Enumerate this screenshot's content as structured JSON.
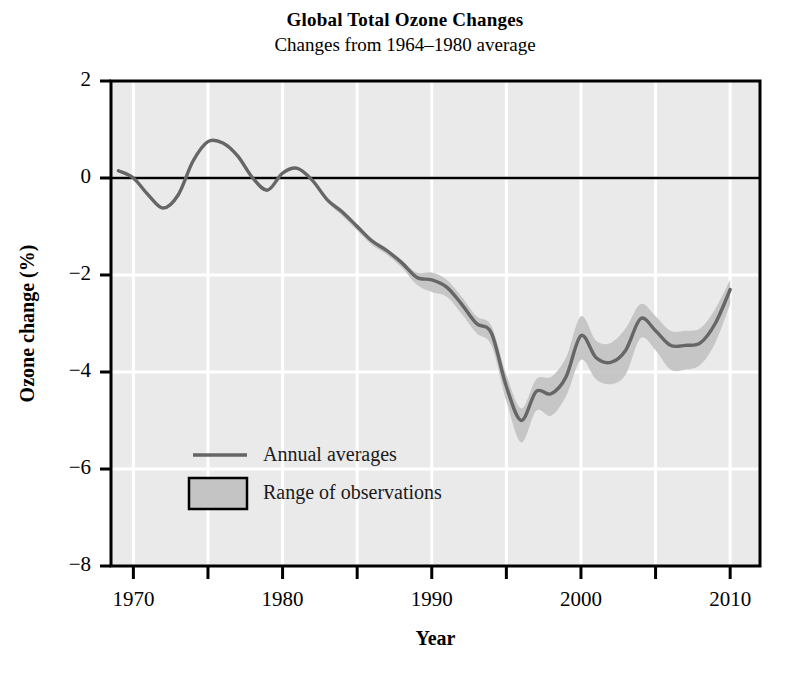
{
  "figure": {
    "title": "Global Total Ozone Changes",
    "subtitle": "Changes from 1964–1980 average",
    "background": "#ffffff"
  },
  "chart_data": {
    "type": "line",
    "title": "Global Total Ozone Changes",
    "subtitle": "Changes from 1964–1980 average",
    "xlabel": "Year",
    "ylabel": "Ozone change (%)",
    "xlim": [
      1968.5,
      2012.0
    ],
    "ylim": [
      -8,
      2
    ],
    "xticks": [
      1970,
      1975,
      1980,
      1985,
      1990,
      1995,
      2000,
      2005,
      2010
    ],
    "xtick_labels": [
      "1970",
      "",
      "1980",
      "",
      "1990",
      "",
      "2000",
      "",
      "2010"
    ],
    "yticks": [
      2,
      0,
      -2,
      -4,
      -6,
      -8
    ],
    "ytick_labels": [
      "2",
      "0",
      "−2",
      "−4",
      "−6",
      "−8"
    ],
    "grid": true,
    "grid_color": "#ffffff",
    "plot_background": "#eaeaea",
    "zero_line": 0,
    "zero_line_color": "#000000",
    "legend_position": "inside-lower-left",
    "legend": [
      {
        "name": "Annual averages",
        "type": "line",
        "color": "#666666"
      },
      {
        "name": "Range of observations",
        "type": "band",
        "color": "#c4c4c4",
        "edge": "#000000"
      }
    ],
    "series": [
      {
        "name": "Annual averages",
        "color": "#666666",
        "x": [
          1969,
          1970,
          1971,
          1972,
          1973,
          1974,
          1975,
          1976,
          1977,
          1978,
          1979,
          1980,
          1981,
          1982,
          1983,
          1984,
          1985,
          1986,
          1987,
          1988,
          1989,
          1990,
          1991,
          1992,
          1993,
          1994,
          1995,
          1996,
          1997,
          1998,
          1999,
          2000,
          2001,
          2002,
          2003,
          2004,
          2005,
          2006,
          2007,
          2008,
          2009,
          2010
        ],
        "values": [
          0.15,
          0.0,
          -0.35,
          -0.62,
          -0.35,
          0.35,
          0.75,
          0.72,
          0.45,
          0.0,
          -0.25,
          0.1,
          0.2,
          -0.05,
          -0.45,
          -0.7,
          -1.0,
          -1.3,
          -1.5,
          -1.75,
          -2.05,
          -2.1,
          -2.25,
          -2.6,
          -3.0,
          -3.2,
          -4.3,
          -5.0,
          -4.4,
          -4.45,
          -4.1,
          -3.25,
          -3.7,
          -3.8,
          -3.55,
          -2.9,
          -3.15,
          -3.45,
          -3.45,
          -3.4,
          -3.0,
          -2.3
        ]
      }
    ],
    "band": {
      "name": "Range of observations",
      "color": "#c4c4c4",
      "x": [
        1969,
        1970,
        1971,
        1972,
        1973,
        1974,
        1975,
        1976,
        1977,
        1978,
        1979,
        1980,
        1981,
        1982,
        1983,
        1984,
        1985,
        1986,
        1987,
        1988,
        1989,
        1990,
        1991,
        1992,
        1993,
        1994,
        1995,
        1996,
        1997,
        1998,
        1999,
        2000,
        2001,
        2002,
        2003,
        2004,
        2005,
        2006,
        2007,
        2008,
        2009,
        2010
      ],
      "upper": [
        0.15,
        0.0,
        -0.35,
        -0.62,
        -0.35,
        0.35,
        0.75,
        0.72,
        0.45,
        0.0,
        -0.25,
        0.1,
        0.2,
        -0.05,
        -0.42,
        -0.65,
        -0.95,
        -1.25,
        -1.45,
        -1.7,
        -1.95,
        -1.95,
        -2.1,
        -2.45,
        -2.85,
        -3.05,
        -4.05,
        -4.75,
        -4.15,
        -4.1,
        -3.7,
        -2.85,
        -3.35,
        -3.4,
        -3.1,
        -2.6,
        -2.85,
        -3.15,
        -3.15,
        -3.1,
        -2.7,
        -2.1
      ],
      "lower": [
        0.15,
        0.0,
        -0.35,
        -0.62,
        -0.35,
        0.35,
        0.75,
        0.72,
        0.45,
        0.0,
        -0.25,
        0.1,
        0.2,
        -0.05,
        -0.5,
        -0.78,
        -1.08,
        -1.38,
        -1.58,
        -1.85,
        -2.2,
        -2.35,
        -2.45,
        -2.8,
        -3.2,
        -3.45,
        -4.6,
        -5.45,
        -4.8,
        -4.9,
        -4.5,
        -3.75,
        -4.15,
        -4.25,
        -4.05,
        -3.3,
        -3.55,
        -3.95,
        -3.95,
        -3.85,
        -3.4,
        -2.6
      ]
    },
    "annotations": [
      {
        "text": "Minimum around 1995 at about −5.0%"
      },
      {
        "text": "Recovery trend after 1995"
      }
    ]
  },
  "axes": {
    "y_title": "Ozone change (%)",
    "x_title": "Year"
  }
}
